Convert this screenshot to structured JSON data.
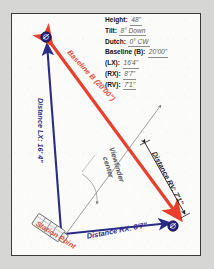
{
  "document": {
    "title": "Camera Station Triangulation Diagram",
    "page_background": "#d6d6d4",
    "paper_background": "#fbfbfa",
    "border_color": "#3a3a3a"
  },
  "colors": {
    "baseline_red": "#e8402a",
    "distance_navy": "#2b2c86",
    "station_label_red": "#e0513a",
    "annotation_gray": "#55555a",
    "rv_black": "#1c1c1c",
    "node_fill": "#23237a"
  },
  "specs": {
    "rows": [
      {
        "key": "Height:",
        "value": "48\""
      },
      {
        "key": "Tilt:",
        "value": "8° Down"
      },
      {
        "key": "Dutch:",
        "value": "0° CW"
      },
      {
        "key": "Baseline (B):",
        "value": "20'00\""
      },
      {
        "key": "(LX):",
        "value": "16'4\""
      },
      {
        "key": "(RX):",
        "value": "8'7\""
      },
      {
        "key": "(RV):",
        "value": "7'1\""
      }
    ]
  },
  "diagram": {
    "baseline_label": "Baseline B (20'00\")",
    "lx_label": "Distance LX: 16' 4\"",
    "rx_label": "Distance RX: 8'7\"",
    "rv_label": "Distance RV: 7'1\"",
    "station_label": "Station Point",
    "viewfinder_label_line1": "Viewfinder",
    "viewfinder_label_line2": "center",
    "nodes": [
      {
        "id": "left-node",
        "label": "L",
        "x": 33,
        "y": 23
      },
      {
        "id": "right-node",
        "label": "R",
        "x": 162,
        "y": 212
      }
    ],
    "geometry": {
      "station_point": {
        "x": 50,
        "y": 219
      },
      "left_vertex": {
        "x": 33,
        "y": 23
      },
      "right_vertex": {
        "x": 162,
        "y": 212
      },
      "baseline_far_end": {
        "x": 170,
        "y": 202
      }
    }
  }
}
